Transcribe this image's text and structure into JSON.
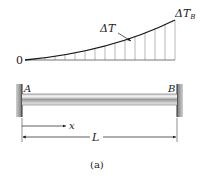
{
  "figure": {
    "caption": "(a)",
    "temperature_plot": {
      "origin_label": "0",
      "curve_label": "ΔT",
      "end_label_main": "ΔT",
      "end_label_sub": "B",
      "hatch_x": [
        35,
        45,
        55,
        65,
        75,
        85,
        95,
        105,
        115,
        125,
        135,
        145,
        155,
        165,
        175
      ]
    },
    "beam": {
      "left_support_label": "A",
      "right_support_label": "B",
      "position_label": "x",
      "length_label": "L"
    }
  },
  "colors": {
    "line": "#1a1a1a",
    "hatch": "#777777",
    "wall": "#8a8a8a",
    "wall_edge": "#2a2a2a",
    "beam_light": "#e6e6e6",
    "beam_mid": "#9a9a9a",
    "beam_dark": "#5c5c5c"
  }
}
